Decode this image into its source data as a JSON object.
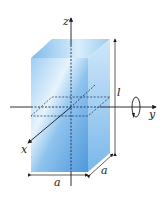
{
  "figure": {
    "type": "rectangular-block-rotation",
    "labels": {
      "z_axis": "z",
      "y_axis": "y",
      "x_axis": "x",
      "length": "l",
      "width_bottom": "a",
      "depth_side": "a"
    },
    "colors": {
      "block_front": "#5fa3e0",
      "block_light": "#d6ecfb",
      "block_side": "#8cc4ee",
      "block_top": "#a9d3f3",
      "lines": "#1a1a1a",
      "dashed": "#1a2a4a"
    }
  }
}
